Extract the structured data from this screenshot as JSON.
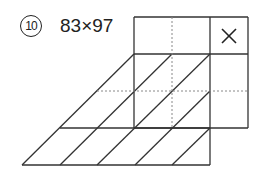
{
  "problem": {
    "number": "10",
    "expression": "83×97",
    "operator_symbol": "×"
  },
  "grid": {
    "columns_x": [
      134,
      172,
      210,
      248
    ],
    "rows_y": [
      17,
      54,
      91,
      128,
      165
    ],
    "line_color": "#333333",
    "dotted_color": "#888888"
  }
}
